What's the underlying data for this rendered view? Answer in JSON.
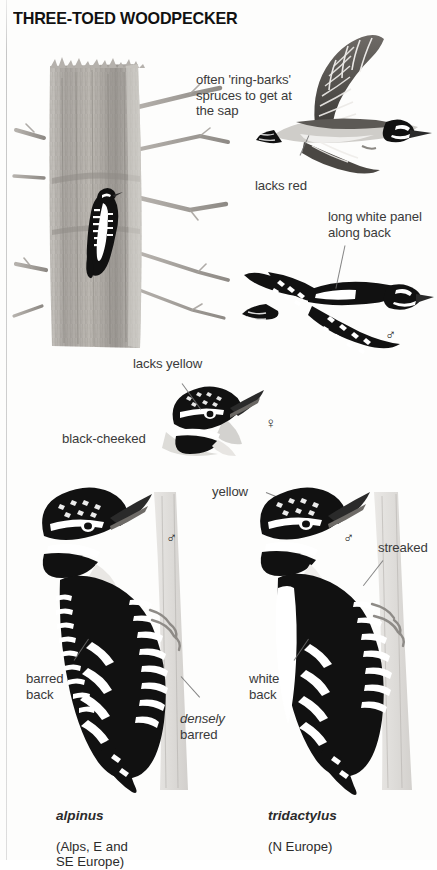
{
  "page": {
    "title": "THREE-TOED WOODPECKER",
    "background_color": "#fdfdfc",
    "ink_color": "#111111",
    "label_color": "#3a3a3a"
  },
  "annotations": [
    {
      "id": "ring-barks",
      "text": "often 'ring-barks'\nspruces to get at\nthe sap"
    },
    {
      "id": "lacks-red",
      "text": "lacks red"
    },
    {
      "id": "long-white-panel",
      "text": "long white panel\nalong back"
    },
    {
      "id": "lacks-yellow",
      "text": "lacks yellow"
    },
    {
      "id": "black-cheeked",
      "text": "black-cheeked"
    },
    {
      "id": "yellow",
      "text": "yellow"
    },
    {
      "id": "streaked",
      "text": "streaked"
    },
    {
      "id": "barred-back",
      "text": "barred\nback"
    },
    {
      "id": "densely-barred",
      "text": "densely\nbarred"
    },
    {
      "id": "white-back",
      "text": "white\nback"
    }
  ],
  "sex_symbols": [
    {
      "id": "flight-upper-male",
      "glyph": "♂"
    },
    {
      "id": "head-portrait-female",
      "glyph": "♀"
    },
    {
      "id": "alpinus-male",
      "glyph": "♂"
    },
    {
      "id": "tridactylus-male",
      "glyph": "♂"
    }
  ],
  "captions": [
    {
      "id": "alpinus",
      "scientific": "alpinus",
      "range": "(Alps, E and\nSE Europe)"
    },
    {
      "id": "tridactylus",
      "scientific": "tridactylus",
      "range": "(N Europe)"
    }
  ],
  "figures": [
    {
      "id": "tree-trunk-with-woodpecker",
      "description": "spruce trunk ring-barked, woodpecker clinging"
    },
    {
      "id": "flight-underside",
      "description": "bird in flight seen from below"
    },
    {
      "id": "flight-upperside",
      "description": "bird in flight seen from above, white back panel"
    },
    {
      "id": "head-portrait",
      "description": "female head portrait, black cheek"
    },
    {
      "id": "perched-alpinus",
      "description": "alpinus climbing trunk"
    },
    {
      "id": "perched-tridactylus",
      "description": "tridactylus climbing trunk"
    }
  ]
}
